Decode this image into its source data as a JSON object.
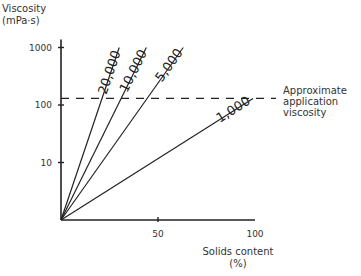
{
  "chart_data": {
    "type": "line",
    "title": "",
    "ylabel": "Viscosity",
    "ylabel_units": "(mPa·s)",
    "xlabel": "Solids content",
    "xlabel_units": "(%)",
    "y_scale": "log",
    "ylim": [
      1,
      1000
    ],
    "xlim": [
      0,
      100
    ],
    "x_ticks": [
      50,
      100
    ],
    "x_tick_labels": [
      "50",
      "100"
    ],
    "y_ticks": [
      10,
      100,
      1000
    ],
    "y_tick_labels": [
      "10",
      "100",
      "1000"
    ],
    "grid": false,
    "series": [
      {
        "name": "20,000",
        "label": "20,000",
        "points": [
          [
            0,
            1
          ],
          [
            30,
            1000
          ]
        ]
      },
      {
        "name": "10,000",
        "label": "10,000",
        "points": [
          [
            0,
            1
          ],
          [
            44,
            1000
          ]
        ]
      },
      {
        "name": "5,000",
        "label": "5,000",
        "points": [
          [
            0,
            1
          ],
          [
            63,
            1000
          ]
        ]
      },
      {
        "name": "1,000",
        "label": "1,000",
        "points": [
          [
            0,
            1
          ],
          [
            99,
            130
          ]
        ]
      }
    ],
    "reference_line": {
      "type": "horizontal-dashed",
      "y": 130,
      "label_lines": [
        "Approximate",
        "application",
        "viscosity"
      ]
    }
  }
}
